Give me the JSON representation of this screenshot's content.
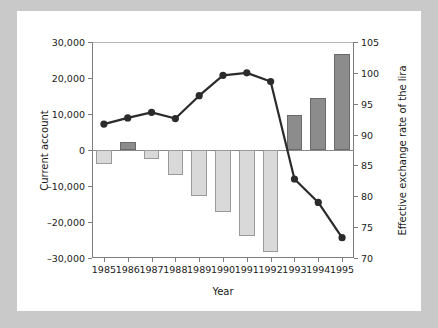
{
  "chart_data": {
    "type": "bar",
    "title": "",
    "xlabel": "Year",
    "ylabel": "Current account",
    "y2label": "Effective exchange rate of the lira",
    "categories": [
      "1985",
      "1986",
      "1987",
      "1988",
      "1989",
      "1990",
      "1991",
      "1992",
      "1993",
      "1994",
      "1995"
    ],
    "grid": false,
    "legend": "none",
    "ylim": [
      -30000,
      30000
    ],
    "y_ticks": [
      30000,
      20000,
      10000,
      0,
      -10000,
      -20000,
      -30000
    ],
    "y_tick_labels": [
      "30,000",
      "20,000",
      "10,000",
      "0",
      "–10,000",
      "–20,000",
      "–30,000"
    ],
    "y2lim": [
      70,
      105
    ],
    "y2_ticks": [
      105,
      100,
      95,
      90,
      85,
      80,
      75,
      70
    ],
    "y2_tick_labels": [
      "105",
      "100",
      "95",
      "90",
      "85",
      "80",
      "75",
      "70"
    ],
    "series": [
      {
        "name": "Current account",
        "type": "bar",
        "axis": "left",
        "values": [
          -4000,
          2200,
          -2500,
          -7000,
          -12700,
          -17200,
          -24000,
          -28400,
          9600,
          14500,
          26800
        ],
        "positive_color": "#8c8c8c",
        "negative_color": "#d9d9d9"
      },
      {
        "name": "Effective exchange rate of the lira",
        "type": "line",
        "axis": "right",
        "values": [
          91.7,
          92.7,
          93.6,
          92.6,
          96.3,
          99.6,
          100.0,
          98.6,
          82.8,
          79.0,
          73.3
        ],
        "color": "#2b2b2b",
        "marker": "circle"
      }
    ]
  },
  "figure": {
    "background": "#ffffff",
    "page_background": "#c9c9c9",
    "axis_color": "#7d7d7d"
  }
}
